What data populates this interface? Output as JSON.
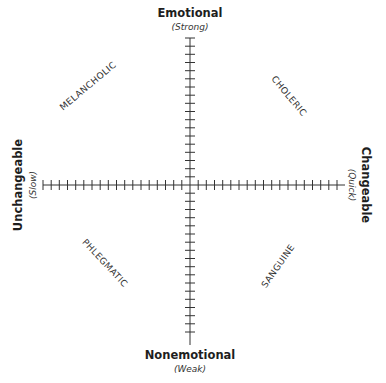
{
  "diagram": {
    "axes": {
      "vertical": {
        "top": {
          "label": "Emotional",
          "sub": "(Strong)"
        },
        "bottom": {
          "label": "Nonemotional",
          "sub": "(Weak)"
        }
      },
      "horizontal": {
        "left": {
          "label": "Unchangeable",
          "sub": "(Slow)"
        },
        "right": {
          "label": "Changeable",
          "sub": "(Quick)"
        }
      }
    },
    "quadrants": {
      "top_left": "MELANCHOLIC",
      "top_right": "CHOLERIC",
      "bottom_left": "PHLEGMATIC",
      "bottom_right": "SANGUINE"
    },
    "ticks_per_half_axis": 18,
    "line_color": "#333333"
  }
}
